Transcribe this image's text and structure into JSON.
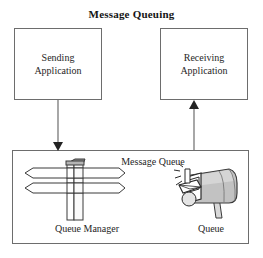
{
  "diagram": {
    "title": "Message Queuing",
    "type": "block-diagram",
    "nodes": {
      "sending_application": {
        "label_line1": "Sending",
        "label_line2": "Application"
      },
      "receiving_application": {
        "label_line1": "Receiving",
        "label_line2": "Application"
      },
      "message_queue": {
        "label": "Message Queue",
        "icons": [
          {
            "name": "signpost-icon",
            "caption": "Queue Manager"
          },
          {
            "name": "mailbox-icon",
            "caption": "Queue"
          }
        ]
      }
    },
    "connectors": [
      {
        "name": "send-arrow",
        "from": "sending_application",
        "to": "message_queue",
        "direction": "down"
      },
      {
        "name": "receive-arrow",
        "from": "message_queue",
        "to": "receiving_application",
        "direction": "up"
      }
    ],
    "colors": {
      "background": "#ffffff",
      "border": "#6d6d6d",
      "text": "#262626",
      "title": "#141414",
      "arrow": "#4d4d4d",
      "icon_outline": "#3a3a3a",
      "icon_fill": "#ffffff",
      "icon_shade": "#b4b4b4"
    }
  }
}
